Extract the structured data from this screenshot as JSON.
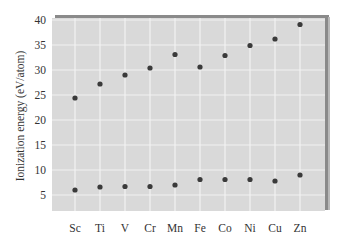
{
  "chart_data": {
    "type": "scatter",
    "title": "",
    "xlabel": "",
    "ylabel": "Ionization energy (eV/atom)",
    "categories": [
      "Sc",
      "Ti",
      "V",
      "Cr",
      "Mn",
      "Fe",
      "Co",
      "Ni",
      "Cu",
      "Zn"
    ],
    "yticks": [
      5,
      10,
      15,
      20,
      25,
      30,
      35,
      40
    ],
    "ylim": [
      2,
      40
    ],
    "grid": true,
    "legend": null,
    "series": [
      {
        "name": "Upper series",
        "values": [
          24.4,
          27.2,
          29.0,
          30.4,
          33.1,
          30.6,
          32.9,
          34.9,
          36.2,
          39.1
        ]
      },
      {
        "name": "Lower series",
        "values": [
          6.0,
          6.6,
          6.7,
          6.7,
          7.0,
          8.1,
          8.1,
          8.1,
          7.8,
          9.0
        ]
      }
    ]
  },
  "colors": {
    "plot_bg": "#d9d9d9",
    "grid": "#f2f2f2",
    "marker": "#3a3a3a",
    "shadow": "#8a8a8a"
  }
}
